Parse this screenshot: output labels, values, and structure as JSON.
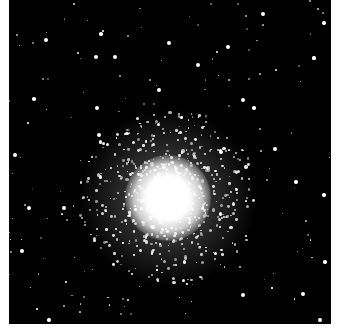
{
  "image": {
    "subject": "globular star cluster",
    "background_color": "#000000",
    "frame_color": "#ffffff",
    "core_center": [
      159,
      198
    ],
    "core_radius": 38,
    "halo_radius": 90
  },
  "bright_stars": [
    [
      92,
      34
    ],
    [
      254,
      14
    ],
    [
      315,
      23
    ],
    [
      87,
      57
    ],
    [
      88,
      108
    ],
    [
      90,
      135
    ],
    [
      25,
      99
    ],
    [
      6,
      155
    ],
    [
      20,
      208
    ],
    [
      13,
      251
    ],
    [
      287,
      182
    ],
    [
      315,
      195
    ],
    [
      316,
      262
    ],
    [
      294,
      294
    ],
    [
      234,
      295
    ],
    [
      40,
      320
    ],
    [
      311,
      320
    ],
    [
      234,
      100
    ],
    [
      212,
      152
    ],
    [
      55,
      208
    ],
    [
      106,
      57
    ],
    [
      37,
      40
    ],
    [
      160,
      43
    ],
    [
      219,
      47
    ],
    [
      305,
      58
    ],
    [
      150,
      90
    ],
    [
      245,
      108
    ],
    [
      266,
      149
    ],
    [
      189,
      65
    ]
  ]
}
